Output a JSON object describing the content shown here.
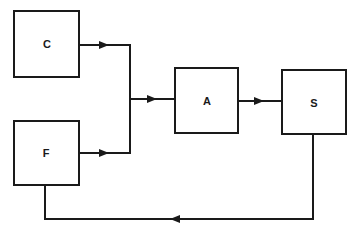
{
  "diagram": {
    "type": "block-diagram",
    "nodes": [
      {
        "id": "C",
        "label": "C"
      },
      {
        "id": "F",
        "label": "F"
      },
      {
        "id": "A",
        "label": "A"
      },
      {
        "id": "S",
        "label": "S"
      }
    ],
    "edges": [
      {
        "from": "C",
        "to": "A",
        "note": "via junction"
      },
      {
        "from": "F",
        "to": "A",
        "note": "via junction"
      },
      {
        "from": "A",
        "to": "S"
      },
      {
        "from": "S",
        "to": "F",
        "note": "feedback path along bottom"
      }
    ],
    "colors": {
      "stroke": "#1a1a1a",
      "background": "#ffffff"
    }
  }
}
